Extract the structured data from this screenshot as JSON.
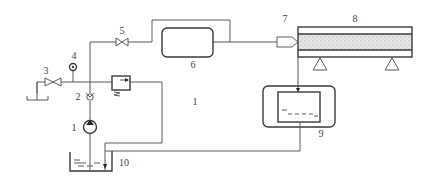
{
  "diagram": {
    "type": "hydraulic-schematic",
    "colors": {
      "line": "#5a5a5a",
      "background": "#ffffff",
      "sand": "#d8d8d8"
    },
    "labels": {
      "pump": "1",
      "check_valve": "2",
      "valve_3": "3",
      "gauge": "4",
      "valve_5": "5",
      "vessel": "6",
      "nozzle": "7",
      "conduit": "8",
      "collection_tank": "9",
      "reservoir": "10",
      "extra": "1"
    }
  }
}
